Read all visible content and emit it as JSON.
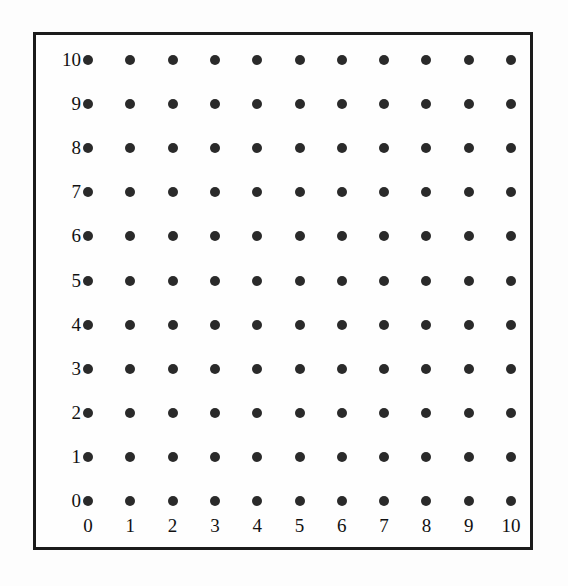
{
  "figure": {
    "title": "",
    "background_color": "#fdfdfd",
    "frame_color": "#1b1b1b",
    "dot_color": "#2a2a2a"
  },
  "chart_data": {
    "type": "scatter",
    "title": "",
    "subtitle": "",
    "xlabel": "",
    "ylabel": "",
    "xlim": [
      0,
      10
    ],
    "ylim": [
      0,
      10
    ],
    "grid": false,
    "legend": null,
    "marker": "filled-circle",
    "x_tick_labels": [
      "0",
      "1",
      "2",
      "3",
      "4",
      "5",
      "6",
      "7",
      "8",
      "9",
      "10"
    ],
    "y_tick_labels": [
      "10",
      "9",
      "8",
      "7",
      "6",
      "5",
      "4",
      "3",
      "2",
      "1",
      "0"
    ],
    "x_ticks": [
      0,
      1,
      2,
      3,
      4,
      5,
      6,
      7,
      8,
      9,
      10
    ],
    "y_ticks": [
      10,
      9,
      8,
      7,
      6,
      5,
      4,
      3,
      2,
      1,
      0
    ],
    "points": [
      {
        "x": 0,
        "y": 0
      },
      {
        "x": 1,
        "y": 0
      },
      {
        "x": 2,
        "y": 0
      },
      {
        "x": 3,
        "y": 0
      },
      {
        "x": 4,
        "y": 0
      },
      {
        "x": 5,
        "y": 0
      },
      {
        "x": 6,
        "y": 0
      },
      {
        "x": 7,
        "y": 0
      },
      {
        "x": 8,
        "y": 0
      },
      {
        "x": 9,
        "y": 0
      },
      {
        "x": 10,
        "y": 0
      },
      {
        "x": 0,
        "y": 1
      },
      {
        "x": 1,
        "y": 1
      },
      {
        "x": 2,
        "y": 1
      },
      {
        "x": 3,
        "y": 1
      },
      {
        "x": 4,
        "y": 1
      },
      {
        "x": 5,
        "y": 1
      },
      {
        "x": 6,
        "y": 1
      },
      {
        "x": 7,
        "y": 1
      },
      {
        "x": 8,
        "y": 1
      },
      {
        "x": 9,
        "y": 1
      },
      {
        "x": 10,
        "y": 1
      },
      {
        "x": 0,
        "y": 2
      },
      {
        "x": 1,
        "y": 2
      },
      {
        "x": 2,
        "y": 2
      },
      {
        "x": 3,
        "y": 2
      },
      {
        "x": 4,
        "y": 2
      },
      {
        "x": 5,
        "y": 2
      },
      {
        "x": 6,
        "y": 2
      },
      {
        "x": 7,
        "y": 2
      },
      {
        "x": 8,
        "y": 2
      },
      {
        "x": 9,
        "y": 2
      },
      {
        "x": 10,
        "y": 2
      },
      {
        "x": 0,
        "y": 3
      },
      {
        "x": 1,
        "y": 3
      },
      {
        "x": 2,
        "y": 3
      },
      {
        "x": 3,
        "y": 3
      },
      {
        "x": 4,
        "y": 3
      },
      {
        "x": 5,
        "y": 3
      },
      {
        "x": 6,
        "y": 3
      },
      {
        "x": 7,
        "y": 3
      },
      {
        "x": 8,
        "y": 3
      },
      {
        "x": 9,
        "y": 3
      },
      {
        "x": 10,
        "y": 3
      },
      {
        "x": 0,
        "y": 4
      },
      {
        "x": 1,
        "y": 4
      },
      {
        "x": 2,
        "y": 4
      },
      {
        "x": 3,
        "y": 4
      },
      {
        "x": 4,
        "y": 4
      },
      {
        "x": 5,
        "y": 4
      },
      {
        "x": 6,
        "y": 4
      },
      {
        "x": 7,
        "y": 4
      },
      {
        "x": 8,
        "y": 4
      },
      {
        "x": 9,
        "y": 4
      },
      {
        "x": 10,
        "y": 4
      },
      {
        "x": 0,
        "y": 5
      },
      {
        "x": 1,
        "y": 5
      },
      {
        "x": 2,
        "y": 5
      },
      {
        "x": 3,
        "y": 5
      },
      {
        "x": 4,
        "y": 5
      },
      {
        "x": 5,
        "y": 5
      },
      {
        "x": 6,
        "y": 5
      },
      {
        "x": 7,
        "y": 5
      },
      {
        "x": 8,
        "y": 5
      },
      {
        "x": 9,
        "y": 5
      },
      {
        "x": 10,
        "y": 5
      },
      {
        "x": 0,
        "y": 6
      },
      {
        "x": 1,
        "y": 6
      },
      {
        "x": 2,
        "y": 6
      },
      {
        "x": 3,
        "y": 6
      },
      {
        "x": 4,
        "y": 6
      },
      {
        "x": 5,
        "y": 6
      },
      {
        "x": 6,
        "y": 6
      },
      {
        "x": 7,
        "y": 6
      },
      {
        "x": 8,
        "y": 6
      },
      {
        "x": 9,
        "y": 6
      },
      {
        "x": 10,
        "y": 6
      },
      {
        "x": 0,
        "y": 7
      },
      {
        "x": 1,
        "y": 7
      },
      {
        "x": 2,
        "y": 7
      },
      {
        "x": 3,
        "y": 7
      },
      {
        "x": 4,
        "y": 7
      },
      {
        "x": 5,
        "y": 7
      },
      {
        "x": 6,
        "y": 7
      },
      {
        "x": 7,
        "y": 7
      },
      {
        "x": 8,
        "y": 7
      },
      {
        "x": 9,
        "y": 7
      },
      {
        "x": 10,
        "y": 7
      },
      {
        "x": 0,
        "y": 8
      },
      {
        "x": 1,
        "y": 8
      },
      {
        "x": 2,
        "y": 8
      },
      {
        "x": 3,
        "y": 8
      },
      {
        "x": 4,
        "y": 8
      },
      {
        "x": 5,
        "y": 8
      },
      {
        "x": 6,
        "y": 8
      },
      {
        "x": 7,
        "y": 8
      },
      {
        "x": 8,
        "y": 8
      },
      {
        "x": 9,
        "y": 8
      },
      {
        "x": 10,
        "y": 8
      },
      {
        "x": 0,
        "y": 9
      },
      {
        "x": 1,
        "y": 9
      },
      {
        "x": 2,
        "y": 9
      },
      {
        "x": 3,
        "y": 9
      },
      {
        "x": 4,
        "y": 9
      },
      {
        "x": 5,
        "y": 9
      },
      {
        "x": 6,
        "y": 9
      },
      {
        "x": 7,
        "y": 9
      },
      {
        "x": 8,
        "y": 9
      },
      {
        "x": 9,
        "y": 9
      },
      {
        "x": 10,
        "y": 9
      },
      {
        "x": 0,
        "y": 10
      },
      {
        "x": 1,
        "y": 10
      },
      {
        "x": 2,
        "y": 10
      },
      {
        "x": 3,
        "y": 10
      },
      {
        "x": 4,
        "y": 10
      },
      {
        "x": 5,
        "y": 10
      },
      {
        "x": 6,
        "y": 10
      },
      {
        "x": 7,
        "y": 10
      },
      {
        "x": 8,
        "y": 10
      },
      {
        "x": 9,
        "y": 10
      },
      {
        "x": 10,
        "y": 10
      }
    ]
  },
  "geometry": {
    "dot_origin_x": 52,
    "dot_origin_y": 25,
    "step_x": 42.3,
    "step_y": 44.1,
    "dot_diameter": 10,
    "y_label_right_edge": 45,
    "x_label_baseline_y": 481
  }
}
